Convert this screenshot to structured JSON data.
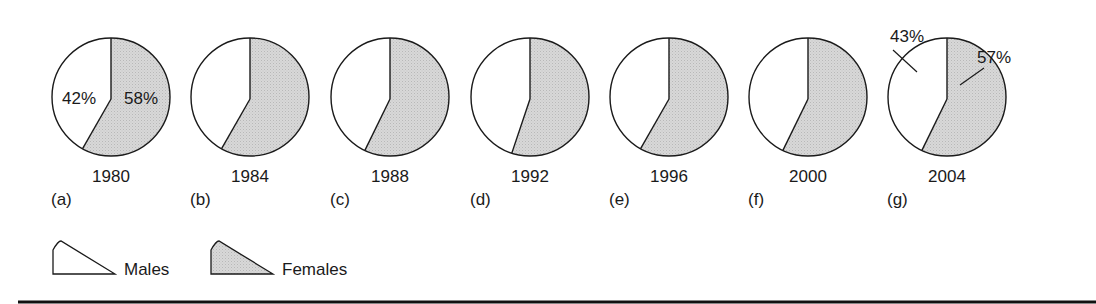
{
  "chart_data": {
    "type": "pie",
    "title": "",
    "categories": [
      "Males",
      "Females"
    ],
    "colors": {
      "Males": "#ffffff",
      "Females": "#d6d6d6"
    },
    "pies": [
      {
        "panel": "(a)",
        "year": "1980",
        "Males": 42,
        "Females": 58,
        "show_labels": true
      },
      {
        "panel": "(b)",
        "year": "1984",
        "Males": 42,
        "Females": 58,
        "show_labels": false
      },
      {
        "panel": "(c)",
        "year": "1988",
        "Males": 43,
        "Females": 57,
        "show_labels": false
      },
      {
        "panel": "(d)",
        "year": "1992",
        "Males": 45,
        "Females": 55,
        "show_labels": false
      },
      {
        "panel": "(e)",
        "year": "1996",
        "Males": 42,
        "Females": 58,
        "show_labels": false
      },
      {
        "panel": "(f)",
        "year": "2000",
        "Males": 43,
        "Females": 57,
        "show_labels": false
      },
      {
        "panel": "(g)",
        "year": "2004",
        "Males": 43,
        "Females": 57,
        "show_labels": true,
        "callouts": true
      }
    ],
    "legend": {
      "position": "bottom-left",
      "entries": [
        "Males",
        "Females"
      ]
    }
  }
}
